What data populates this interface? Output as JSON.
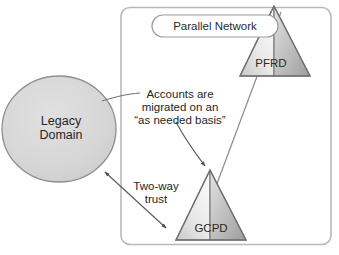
{
  "diagram": {
    "title_shape_label": "Parallel Network",
    "legacy_domain": {
      "line1": "Legacy",
      "line2": "Domain",
      "label": "Legacy\nDomain"
    },
    "annotations": {
      "accounts_note": "Accounts are\nmigrated on an\n“as needed basis”",
      "trust_note": "Two-way\ntrust"
    },
    "nodes": [
      {
        "id": "pfrd",
        "label": "PFRD"
      },
      {
        "id": "gcpd",
        "label": "GCPD"
      }
    ],
    "colors": {
      "container_border": "#b8b8b8",
      "container_fill": "#ffffff",
      "circle_fill": "#d6d6d6",
      "circle_stroke": "#8c8c8c",
      "triangle_left_light": "#f2f2f2",
      "triangle_right_dark": "#a9a9a9",
      "triangle_stroke": "#7d7d7d",
      "line_stroke": "#5a5a5a",
      "text": "#262626",
      "page_background": "#ffffff"
    }
  }
}
